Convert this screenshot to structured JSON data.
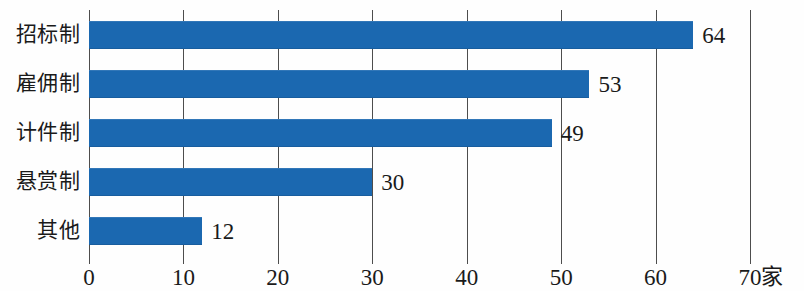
{
  "chart_data": {
    "type": "bar",
    "orientation": "horizontal",
    "title": "",
    "subtitle": "",
    "xlabel": "",
    "ylabel": "",
    "unit_label": "家",
    "categories": [
      "招标制",
      "雇佣制",
      "计件制",
      "悬赏制",
      "其他"
    ],
    "values": [
      64,
      53,
      49,
      30,
      12
    ],
    "value_labels": [
      "64",
      "53",
      "49",
      "30",
      "12"
    ],
    "xlim": [
      0,
      70
    ],
    "xticks": [
      0,
      10,
      20,
      30,
      40,
      50,
      60,
      70
    ],
    "xtick_labels": [
      "0",
      "10",
      "20",
      "30",
      "40",
      "50",
      "60",
      "70"
    ],
    "grid": "vertical",
    "legend": "none",
    "bar_color": "#1b68b0",
    "gridline_color": "#4d4d4d",
    "text_color": "#1a1a1a",
    "background_color": "#fefefe"
  }
}
